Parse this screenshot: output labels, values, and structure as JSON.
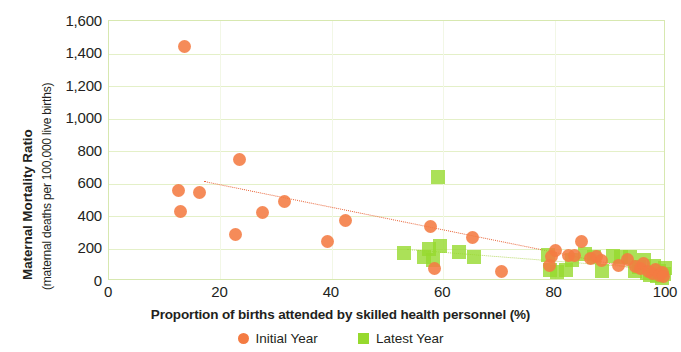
{
  "chart_data": {
    "type": "scatter",
    "title": "",
    "xlabel": "Proportion of births attended by skilled health personnel (%)",
    "ylabel_main": "Maternal Mortality Ratio",
    "ylabel_sub": "(maternal deaths per 100,000 live births)",
    "xlim": [
      0,
      100
    ],
    "ylim": [
      0,
      1600
    ],
    "xticks": [
      0,
      20,
      40,
      60,
      80,
      100
    ],
    "xtick_labels": [
      "0",
      "20",
      "40",
      "60",
      "80",
      "100"
    ],
    "yticks": [
      0,
      200,
      400,
      600,
      800,
      1000,
      1200,
      1400,
      1600
    ],
    "ytick_labels": [
      "0",
      "200",
      "400",
      "600",
      "800",
      "1,000",
      "1,200",
      "1,400",
      "1,600"
    ],
    "grid": "horizontal",
    "legend_position": "bottom-center",
    "colors": {
      "initial_year": "#f47b42",
      "latest_year": "#96d92e",
      "trend_initial": "#e8663a",
      "trend_latest": "#b9d96a",
      "gridline": "#e4f0c8",
      "plot_border": "#d7e8b0",
      "text": "#231f20"
    },
    "series": [
      {
        "name": "Initial Year",
        "marker": "circle",
        "color": "#f47b42",
        "points": [
          {
            "x": 13.5,
            "y": 1445
          },
          {
            "x": 12.5,
            "y": 555
          },
          {
            "x": 12.8,
            "y": 430
          },
          {
            "x": 16.2,
            "y": 545
          },
          {
            "x": 23.5,
            "y": 745
          },
          {
            "x": 22.8,
            "y": 285
          },
          {
            "x": 27.5,
            "y": 420
          },
          {
            "x": 31.5,
            "y": 490
          },
          {
            "x": 39.2,
            "y": 245
          },
          {
            "x": 42.5,
            "y": 375
          },
          {
            "x": 57.8,
            "y": 335
          },
          {
            "x": 58.5,
            "y": 80
          },
          {
            "x": 65.2,
            "y": 270
          },
          {
            "x": 70.5,
            "y": 60
          },
          {
            "x": 79.0,
            "y": 95
          },
          {
            "x": 79.5,
            "y": 150
          },
          {
            "x": 80.2,
            "y": 185
          },
          {
            "x": 82.5,
            "y": 160
          },
          {
            "x": 83.5,
            "y": 155
          },
          {
            "x": 84.8,
            "y": 245
          },
          {
            "x": 86.5,
            "y": 140
          },
          {
            "x": 87.5,
            "y": 150
          },
          {
            "x": 88.5,
            "y": 125
          },
          {
            "x": 91.5,
            "y": 95
          },
          {
            "x": 93.0,
            "y": 130
          },
          {
            "x": 94.5,
            "y": 90
          },
          {
            "x": 95.5,
            "y": 75
          },
          {
            "x": 96.0,
            "y": 110
          },
          {
            "x": 96.8,
            "y": 60
          },
          {
            "x": 97.5,
            "y": 45
          },
          {
            "x": 98.2,
            "y": 70
          },
          {
            "x": 98.8,
            "y": 35
          },
          {
            "x": 99.3,
            "y": 55
          },
          {
            "x": 99.6,
            "y": 25
          }
        ]
      },
      {
        "name": "Latest Year",
        "marker": "square",
        "color": "#96d92e",
        "points": [
          {
            "x": 59.0,
            "y": 640
          },
          {
            "x": 53.0,
            "y": 175
          },
          {
            "x": 56.5,
            "y": 150
          },
          {
            "x": 57.5,
            "y": 195
          },
          {
            "x": 58.2,
            "y": 130
          },
          {
            "x": 59.5,
            "y": 215
          },
          {
            "x": 62.8,
            "y": 180
          },
          {
            "x": 65.5,
            "y": 145
          },
          {
            "x": 78.8,
            "y": 160
          },
          {
            "x": 79.2,
            "y": 70
          },
          {
            "x": 80.5,
            "y": 55
          },
          {
            "x": 82.0,
            "y": 65
          },
          {
            "x": 83.2,
            "y": 130
          },
          {
            "x": 85.5,
            "y": 165
          },
          {
            "x": 87.0,
            "y": 150
          },
          {
            "x": 88.5,
            "y": 60
          },
          {
            "x": 90.5,
            "y": 155
          },
          {
            "x": 92.0,
            "y": 145
          },
          {
            "x": 93.5,
            "y": 150
          },
          {
            "x": 94.5,
            "y": 60
          },
          {
            "x": 95.2,
            "y": 85
          },
          {
            "x": 96.0,
            "y": 130
          },
          {
            "x": 96.5,
            "y": 50
          },
          {
            "x": 97.2,
            "y": 40
          },
          {
            "x": 97.8,
            "y": 95
          },
          {
            "x": 98.3,
            "y": 30
          },
          {
            "x": 98.8,
            "y": 60
          },
          {
            "x": 99.2,
            "y": 20
          },
          {
            "x": 99.6,
            "y": 45
          },
          {
            "x": 99.8,
            "y": 80
          }
        ]
      }
    ],
    "trendlines": [
      {
        "name": "Initial Year trend",
        "style": "dotted",
        "color": "#e8663a",
        "x_start": 17.0,
        "y_start": 615,
        "x_end": 100.0,
        "y_end": 40
      },
      {
        "name": "Latest Year trend",
        "style": "dotted",
        "color": "#b9d96a",
        "x_start": 53.5,
        "y_start": 200,
        "x_end": 100.0,
        "y_end": 75
      }
    ],
    "legend": [
      {
        "label": "Initial Year",
        "marker": "circle",
        "color": "#f47b42"
      },
      {
        "label": "Latest Year",
        "marker": "square",
        "color": "#96d92e"
      }
    ]
  }
}
